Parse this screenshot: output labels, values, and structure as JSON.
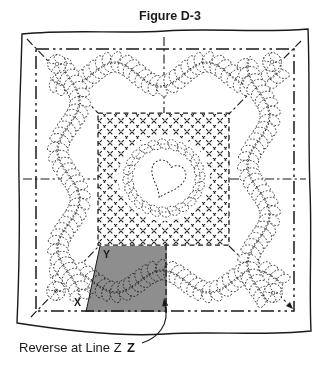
{
  "title": "Figure D-3",
  "labels": {
    "y": "Y",
    "x": "X",
    "z": "Z",
    "reverse_note": "Reverse at Line Z"
  },
  "colors": {
    "ink": "#1a1a1a",
    "shade": "#8e8e8e",
    "paper": "#ffffff"
  }
}
